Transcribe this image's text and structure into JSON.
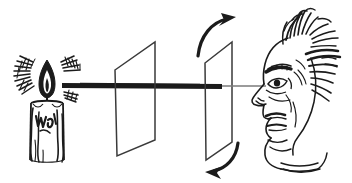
{
  "figure": {
    "caption": "",
    "background_color": "#ffffff",
    "ink_color": "#1b1b1b",
    "faded_ray_color": "#7a7a7a",
    "width": 352,
    "height": 183,
    "style": "pen-and-ink line engraving, vintage"
  },
  "elements": {
    "candle": {
      "label": "candle",
      "body": {
        "x": 30,
        "y": 100,
        "width": 32,
        "height": 62
      },
      "flame": {
        "cx": 47,
        "cy": 80,
        "width": 15,
        "height": 34
      },
      "wick": {
        "x": 47,
        "y": 97
      },
      "drips": 3,
      "inner_marks": "wax squiggles"
    },
    "light_rays": {
      "label": "radiating light hatching",
      "left_fan": {
        "cx": 30,
        "cy": 78,
        "strokes": 13
      },
      "right_fan": {
        "cx": 70,
        "cy": 72,
        "strokes": 11
      },
      "right_lower_fan": {
        "cx": 72,
        "cy": 92,
        "strokes": 7
      }
    },
    "beam": {
      "label": "light beam",
      "bright_segment": {
        "x1": 62,
        "y1": 85,
        "x2": 222,
        "y2": 86,
        "thickness": 5,
        "color": "#1b1b1b"
      },
      "dim_segment": {
        "x1": 222,
        "y1": 86,
        "x2": 264,
        "y2": 86,
        "thickness": 1,
        "color": "#7a7a7a"
      }
    },
    "plate_one": {
      "label": "first polarizing plate",
      "vertices": [
        [
          115,
          70
        ],
        [
          155,
          42
        ],
        [
          155,
          140
        ],
        [
          117,
          156
        ]
      ]
    },
    "plate_two": {
      "label": "second polarizing plate (rotating)",
      "vertices": [
        [
          205,
          63
        ],
        [
          232,
          42
        ],
        [
          232,
          142
        ],
        [
          206,
          160
        ]
      ]
    },
    "rotation_arrow_top": {
      "label": "rotation arrow clockwise top",
      "direction": "up-right"
    },
    "rotation_arrow_bottom": {
      "label": "rotation arrow clockwise bottom",
      "direction": "down-left"
    },
    "observer": {
      "label": "observer head in profile facing left",
      "eye": {
        "cx": 275,
        "cy": 84
      },
      "features": [
        "wild hair",
        "eyebrow",
        "eye",
        "nose",
        "mouth",
        "chin",
        "ear hatching",
        "neck"
      ]
    }
  }
}
